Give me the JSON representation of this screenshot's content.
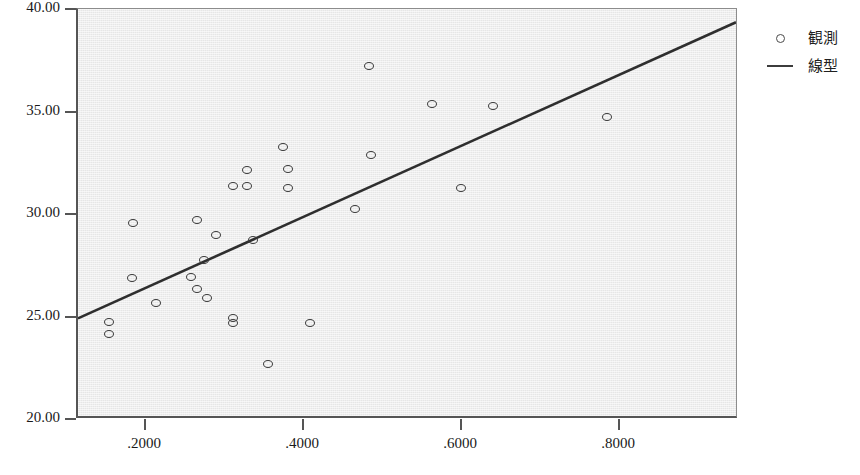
{
  "chart_data": {
    "type": "scatter",
    "title": "",
    "xlabel": "",
    "ylabel": "",
    "xlim": [
      0.1137,
      0.9504
    ],
    "ylim": [
      20.0,
      40.0
    ],
    "grid": false,
    "legend_position": "right",
    "x_ticks": [
      0.2,
      0.4,
      0.6,
      0.8
    ],
    "x_tick_labels": [
      ".2000",
      ".4000",
      ".6000",
      ".8000"
    ],
    "y_ticks": [
      20.0,
      25.0,
      30.0,
      35.0,
      40.0
    ],
    "y_tick_labels": [
      "20.00",
      "25.00",
      "30.00",
      "35.00",
      "40.00"
    ],
    "series": [
      {
        "name": "観測",
        "type": "scatter",
        "marker": "circle-open",
        "color": "#3a3a3a",
        "points": [
          {
            "x": 0.1532,
            "y": 24.75
          },
          {
            "x": 0.1532,
            "y": 24.15
          },
          {
            "x": 0.1836,
            "y": 29.55
          },
          {
            "x": 0.1823,
            "y": 26.9
          },
          {
            "x": 0.2127,
            "y": 25.65
          },
          {
            "x": 0.2646,
            "y": 29.7
          },
          {
            "x": 0.257,
            "y": 26.95
          },
          {
            "x": 0.2646,
            "y": 26.35
          },
          {
            "x": 0.2734,
            "y": 27.75
          },
          {
            "x": 0.2772,
            "y": 25.9
          },
          {
            "x": 0.2886,
            "y": 29.0
          },
          {
            "x": 0.3101,
            "y": 31.35
          },
          {
            "x": 0.3101,
            "y": 24.95
          },
          {
            "x": 0.3101,
            "y": 24.7
          },
          {
            "x": 0.3278,
            "y": 32.15
          },
          {
            "x": 0.3278,
            "y": 31.35
          },
          {
            "x": 0.3354,
            "y": 28.75
          },
          {
            "x": 0.3544,
            "y": 22.7
          },
          {
            "x": 0.3734,
            "y": 33.25
          },
          {
            "x": 0.3797,
            "y": 32.2
          },
          {
            "x": 0.3797,
            "y": 31.25
          },
          {
            "x": 0.4076,
            "y": 24.7
          },
          {
            "x": 0.4646,
            "y": 30.25
          },
          {
            "x": 0.4823,
            "y": 37.2
          },
          {
            "x": 0.4848,
            "y": 32.9
          },
          {
            "x": 0.562,
            "y": 35.35
          },
          {
            "x": 0.5987,
            "y": 31.25
          },
          {
            "x": 0.6392,
            "y": 35.25
          },
          {
            "x": 0.7835,
            "y": 34.75
          }
        ]
      },
      {
        "name": "線型",
        "type": "line",
        "color": "#2e2e2e",
        "x_start": 0.1137,
        "y_start": 24.8,
        "x_end": 0.9504,
        "y_end": 39.35
      }
    ]
  },
  "legend": {
    "items": [
      {
        "label": "観測",
        "key": "circle"
      },
      {
        "label": "線型",
        "key": "line"
      }
    ]
  }
}
